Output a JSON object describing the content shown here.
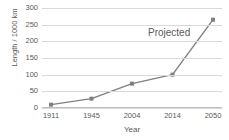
{
  "chart_data": {
    "type": "line",
    "title": "",
    "xlabel": "Year",
    "ylabel": "Length / 1000 km",
    "categories": [
      "1911",
      "1945",
      "2004",
      "2014",
      "2050"
    ],
    "values": [
      10,
      28,
      73,
      100,
      265
    ],
    "ylim": [
      0,
      300
    ],
    "yticks": [
      "0",
      "50",
      "100",
      "150",
      "200",
      "250",
      "300"
    ],
    "ytick_values": [
      0,
      50,
      100,
      150,
      200,
      250,
      300
    ],
    "grid": "horizontal",
    "legend": "none",
    "series_color": "#808080",
    "gridline_color": "#d9d9d9",
    "text_color": "#595959",
    "background_color": "#ffffff",
    "annotations": [
      {
        "text": "Projected",
        "x": "2050",
        "y": 230
      }
    ]
  }
}
